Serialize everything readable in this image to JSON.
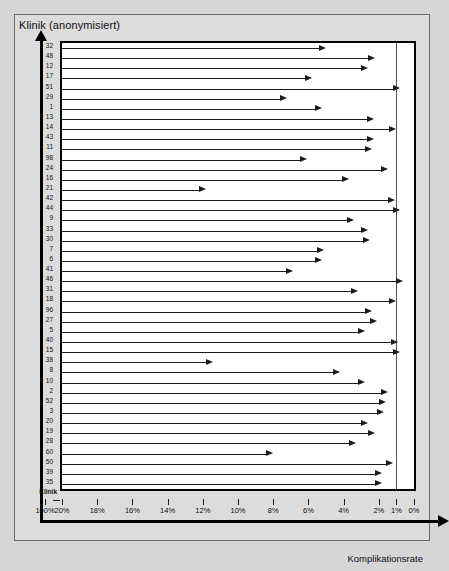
{
  "chart": {
    "title_y": "Klinik (anonymisiert)",
    "title_x": "Komplikationsrate",
    "axis_origin_label": "Klinik"
  },
  "chart_data": {
    "type": "bar",
    "orientation": "horizontal",
    "title": "",
    "ylabel": "Klinik (anonymisiert)",
    "xlabel": "Komplikationsrate",
    "xlim": [
      20,
      0
    ],
    "x_reversed": true,
    "x_axis_break": true,
    "grid": false,
    "legend": null,
    "unit": "%",
    "reference_line": 1,
    "xticks": [
      100,
      20,
      18,
      16,
      14,
      12,
      10,
      8,
      6,
      4,
      2,
      1,
      0
    ],
    "xticklabels": [
      "100%",
      "20%",
      "18%",
      "16%",
      "14%",
      "12%",
      "10%",
      "8%",
      "6%",
      "4%",
      "2%",
      "1%",
      "0%"
    ],
    "categories": [
      "32",
      "48",
      "12",
      "17",
      "51",
      "29",
      "1",
      "13",
      "14",
      "43",
      "11",
      "98",
      "24",
      "16",
      "21",
      "42",
      "44",
      "9",
      "33",
      "30",
      "7",
      "6",
      "41",
      "46",
      "31",
      "18",
      "96",
      "27",
      "5",
      "40",
      "15",
      "38",
      "8",
      "10",
      "2",
      "52",
      "3",
      "20",
      "19",
      "28",
      "60",
      "50",
      "39",
      "35"
    ],
    "values": [
      5.0,
      2.2,
      2.6,
      5.8,
      0.8,
      7.2,
      5.2,
      2.3,
      1.0,
      2.3,
      2.4,
      6.1,
      1.5,
      3.7,
      11.8,
      1.1,
      0.8,
      3.4,
      2.6,
      2.5,
      5.1,
      5.2,
      6.9,
      0.6,
      3.2,
      1.0,
      2.4,
      2.1,
      2.8,
      0.9,
      0.8,
      11.4,
      4.2,
      2.8,
      1.5,
      1.6,
      1.7,
      2.6,
      2.2,
      3.3,
      8.0,
      1.2,
      1.8,
      1.8
    ],
    "series": [
      {
        "name": "Komplikationsrate",
        "values": [
          5.0,
          2.2,
          2.6,
          5.8,
          0.8,
          7.2,
          5.2,
          2.3,
          1.0,
          2.3,
          2.4,
          6.1,
          1.5,
          3.7,
          11.8,
          1.1,
          0.8,
          3.4,
          2.6,
          2.5,
          5.1,
          5.2,
          6.9,
          0.6,
          3.2,
          1.0,
          2.4,
          2.1,
          2.8,
          0.9,
          0.8,
          11.4,
          4.2,
          2.8,
          1.5,
          1.6,
          1.7,
          2.6,
          2.2,
          3.3,
          8.0,
          1.2,
          1.8,
          1.8
        ]
      }
    ]
  }
}
